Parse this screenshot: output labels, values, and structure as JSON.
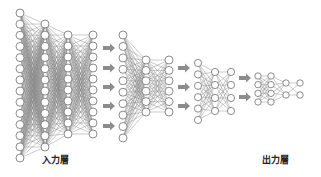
{
  "labels": {
    "input_layer": "入力層",
    "output_layer": "出力層"
  },
  "colors": {
    "node_stroke": "#6e6e6e",
    "edge": "#8a8a8a",
    "arrow": "#8c8c8c"
  },
  "networks": [
    {
      "columns": [
        {
          "x": 20,
          "count": 14,
          "y0": 13,
          "y1": 158
        },
        {
          "x": 45,
          "count": 12,
          "y0": 24,
          "y1": 147
        },
        {
          "x": 68,
          "count": 10,
          "y0": 35,
          "y1": 134
        },
        {
          "x": 93,
          "count": 10,
          "y0": 35,
          "y1": 134
        }
      ]
    },
    {
      "columns": [
        {
          "x": 123,
          "count": 10,
          "y0": 35,
          "y1": 138
        },
        {
          "x": 146,
          "count": 6,
          "y0": 60,
          "y1": 112
        },
        {
          "x": 169,
          "count": 6,
          "y0": 60,
          "y1": 112
        }
      ]
    },
    {
      "columns": [
        {
          "x": 198,
          "count": 6,
          "y0": 63,
          "y1": 120
        },
        {
          "x": 215,
          "count": 4,
          "y0": 72,
          "y1": 111
        },
        {
          "x": 231,
          "count": 4,
          "y0": 72,
          "y1": 111
        }
      ]
    },
    {
      "columns": [
        {
          "x": 258,
          "count": 4,
          "y0": 76,
          "y1": 102
        },
        {
          "x": 271,
          "count": 4,
          "y0": 76,
          "y1": 102
        },
        {
          "x": 286,
          "count": 2,
          "y0": 83,
          "y1": 95
        },
        {
          "x": 300,
          "count": 2,
          "y0": 83,
          "y1": 95
        }
      ]
    }
  ],
  "arrows": [
    {
      "x": 103,
      "y": 48
    },
    {
      "x": 103,
      "y": 68
    },
    {
      "x": 103,
      "y": 87
    },
    {
      "x": 103,
      "y": 106
    },
    {
      "x": 103,
      "y": 126
    },
    {
      "x": 178,
      "y": 68
    },
    {
      "x": 178,
      "y": 87
    },
    {
      "x": 178,
      "y": 106
    },
    {
      "x": 239,
      "y": 78
    },
    {
      "x": 239,
      "y": 97
    }
  ]
}
